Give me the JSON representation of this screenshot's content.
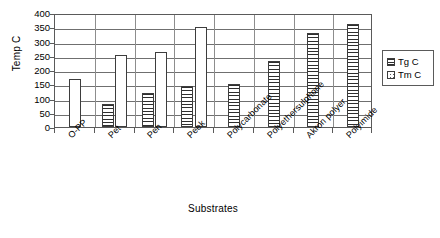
{
  "chart_data": {
    "type": "bar",
    "title": "",
    "xlabel": "Substrates",
    "ylabel": "Temp C",
    "ylim": [
      0,
      400
    ],
    "ytick_step": 50,
    "yticks": [
      400,
      350,
      300,
      250,
      200,
      150,
      100,
      50,
      0
    ],
    "grid": true,
    "legend_position": "right",
    "categories": [
      "O-PP",
      "Pet",
      "Pen",
      "Peek",
      "Polycarbonate",
      "Polyethersulphone",
      "Akron polyer",
      "Polyimide"
    ],
    "series": [
      {
        "name": "Tg C",
        "pattern": "horizontal-lines",
        "values": [
          null,
          80,
          120,
          143,
          150,
          230,
          330,
          360
        ]
      },
      {
        "name": "Tm C",
        "pattern": "dots",
        "values": [
          167,
          253,
          262,
          350,
          null,
          null,
          null,
          null
        ]
      }
    ]
  },
  "legend": {
    "items": [
      {
        "label": "Tg C",
        "pattern": "tg"
      },
      {
        "label": "Tm C",
        "pattern": "tm"
      }
    ]
  }
}
